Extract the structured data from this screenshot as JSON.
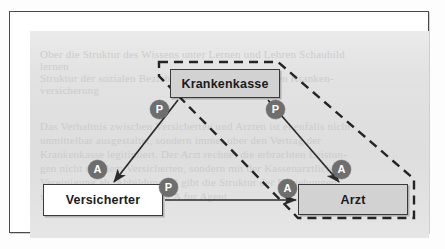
{
  "figure": {
    "frame_color": "#4a4a4a",
    "paper_color": "#e2e2e2",
    "badge_color": "#6e6e6e",
    "node_fill": "#d2d2d2",
    "line_color": "#2b2b2b"
  },
  "nodes": [
    {
      "id": "krankenkasse",
      "label": "Krankenkasse",
      "fill": "grey"
    },
    {
      "id": "versicherter",
      "label": "Versicherter",
      "fill": "white"
    },
    {
      "id": "arzt",
      "label": "Arzt",
      "fill": "grey"
    }
  ],
  "badges": [
    {
      "id": "p-kk-vs",
      "label": "P"
    },
    {
      "id": "p-kk-az",
      "label": "P"
    },
    {
      "id": "a-kk-vs",
      "label": "A"
    },
    {
      "id": "a-kk-az",
      "label": "A"
    },
    {
      "id": "p-vs-az",
      "label": "P"
    },
    {
      "id": "a-vs-az",
      "label": "A"
    }
  ],
  "edges": [
    {
      "id": "kk-to-vs",
      "from": "Krankenkasse",
      "to": "Versicherter",
      "style": "solid",
      "source_role": "P",
      "target_role": "A"
    },
    {
      "id": "kk-to-az",
      "from": "Krankenkasse",
      "to": "Arzt",
      "style": "solid",
      "source_role": "P",
      "target_role": "A"
    },
    {
      "id": "vs-to-az",
      "from": "Versicherter",
      "to": "Arzt",
      "style": "solid",
      "source_role": "P",
      "target_role": "A"
    }
  ],
  "grouping": {
    "id": "dashed-boundary",
    "style": "dashed",
    "members": [
      "Krankenkasse",
      "Arzt"
    ]
  },
  "background_text": [
    {
      "text": "Ober die Struktur des Wissens unter Lernen und Lehren Schaubild",
      "x": 30,
      "y": 36,
      "size": 11
    },
    {
      "text": "lernen",
      "x": 30,
      "y": 48,
      "size": 11
    },
    {
      "text": "Struktur  der  sozialen  Beziehungen  in  der  gesetzlichen  Kranken-",
      "x": 30,
      "y": 60,
      "size": 11
    },
    {
      "text": "versicherung",
      "x": 30,
      "y": 72,
      "size": 11
    },
    {
      "text": "Das Verhaltnis zwischen Versicherten und Arzten ist ebenfalls nicht",
      "x": 30,
      "y": 108,
      "size": 11
    },
    {
      "text": "unmittelbar  ausgestaltet,  sondern  immer  uber  den  Vertrag  der",
      "x": 30,
      "y": 122,
      "size": 11
    },
    {
      "text": "Krankenkasse  legitimiert.  Der  Arzt  rechnet  die  erbrachten  Leistun-",
      "x": 30,
      "y": 136,
      "size": 11
    },
    {
      "text": "gen  nicht  mit  dem  Versicherten,  sondern  mit  der  Kassenarztlichen",
      "x": 30,
      "y": 150,
      "size": 11
    },
    {
      "text": "Vereinigung  ab.  Abbildung  10  gibt  die  Struktur  der  Beziehungen",
      "x": 30,
      "y": 164,
      "size": 11
    },
    {
      "text": "wieder. P steht fur Prinzipal, A fur Agent.",
      "x": 30,
      "y": 178,
      "size": 11
    }
  ]
}
